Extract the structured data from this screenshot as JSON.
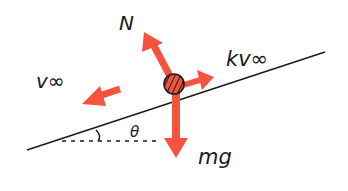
{
  "diagram": {
    "colors": {
      "force_arrow": "#f5533d",
      "line": "#1a1a1a",
      "background": "#ffffff"
    },
    "labels": {
      "normal_force": "N",
      "drag_force": "kv∞",
      "velocity": "v∞",
      "gravity": "mg",
      "angle": "θ"
    },
    "forces": [
      {
        "name": "normal",
        "label": "N",
        "direction": "perpendicular to incline, up-left"
      },
      {
        "name": "drag",
        "label": "kv∞",
        "direction": "along incline, up-right"
      },
      {
        "name": "gravity",
        "label": "mg",
        "direction": "vertically downward"
      }
    ],
    "velocity": {
      "label": "v∞",
      "direction": "down the incline, left"
    },
    "incline": {
      "angle_label": "θ"
    }
  }
}
